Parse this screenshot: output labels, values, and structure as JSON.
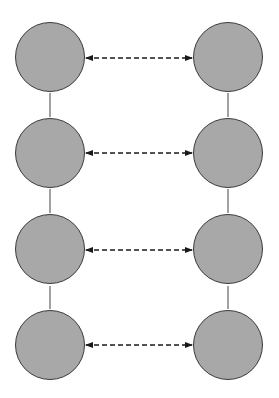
{
  "diagram": {
    "type": "ladder-network",
    "colors": {
      "node_fill": "#a8a8a8",
      "node_stroke": "#3a3a3a",
      "edge": "#444444",
      "arrow": "#1a1a1a",
      "background": "#ffffff"
    },
    "columns": [
      {
        "name": "left",
        "nodes": [
          {
            "id": "L1",
            "label": ""
          },
          {
            "id": "L2",
            "label": ""
          },
          {
            "id": "L3",
            "label": ""
          },
          {
            "id": "L4",
            "label": ""
          }
        ]
      },
      {
        "name": "right",
        "nodes": [
          {
            "id": "R1",
            "label": ""
          },
          {
            "id": "R2",
            "label": ""
          },
          {
            "id": "R3",
            "label": ""
          },
          {
            "id": "R4",
            "label": ""
          }
        ]
      }
    ],
    "solid_edges": [
      [
        "L1",
        "L2"
      ],
      [
        "L2",
        "L3"
      ],
      [
        "L3",
        "L4"
      ],
      [
        "R1",
        "R2"
      ],
      [
        "R2",
        "R3"
      ],
      [
        "R3",
        "R4"
      ]
    ],
    "dashed_bidirectional_arrows": [
      [
        "L1",
        "R1"
      ],
      [
        "L2",
        "R2"
      ],
      [
        "L3",
        "R3"
      ],
      [
        "L4",
        "R4"
      ]
    ]
  }
}
